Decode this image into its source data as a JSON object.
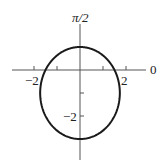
{
  "chart_data": {
    "type": "line",
    "subtype": "polar",
    "title": "",
    "equation": "r = 3 / (2 + sin θ)",
    "xlabel": "",
    "ylabel": "",
    "axis_labels": {
      "polar_axis": "0",
      "vertical_axis": "π/2",
      "top_partial": "2"
    },
    "tick_labels": {
      "x": [
        "−2",
        "2"
      ],
      "y": [
        "−2"
      ]
    },
    "x_ticks": [
      -2,
      -1,
      1,
      2
    ],
    "y_ticks": [
      -2,
      -1
    ],
    "xlim": [
      -3.4,
      3.4
    ],
    "ylim": [
      -4.0,
      3.0
    ],
    "grid": false,
    "legend": null,
    "key_points": [
      {
        "theta": "0",
        "r": 1.5
      },
      {
        "theta": "π/2",
        "r": 1
      },
      {
        "theta": "π",
        "r": 1.5
      },
      {
        "theta": "3π/2",
        "r": 3
      }
    ],
    "colors": {
      "curve": "#1a1a1a",
      "axes": "#555555"
    }
  },
  "labels": {
    "top_fragment": "2",
    "vertical_axis": "π/2",
    "polar_axis": "0",
    "x_neg2": "−2",
    "x_pos2": "2",
    "y_neg2": "−2"
  }
}
